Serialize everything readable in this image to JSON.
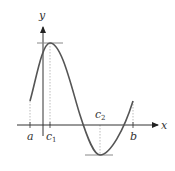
{
  "diagram": {
    "title": "",
    "axes": {
      "x_label": "x",
      "y_label": "y"
    },
    "points": [
      {
        "name": "a",
        "label": "a",
        "sub": ""
      },
      {
        "name": "c1",
        "label": "c",
        "sub": "1"
      },
      {
        "name": "c2",
        "label": "c",
        "sub": "2"
      },
      {
        "name": "b",
        "label": "b",
        "sub": ""
      }
    ],
    "annotations": [
      "horizontal tangent at local maximum (x = c1)",
      "horizontal tangent at local minimum (x = c2)"
    ],
    "colors": {
      "curve": "#555555",
      "axis": "#333333",
      "tangent": "#888888",
      "dotted": "#aaaaaa"
    }
  }
}
